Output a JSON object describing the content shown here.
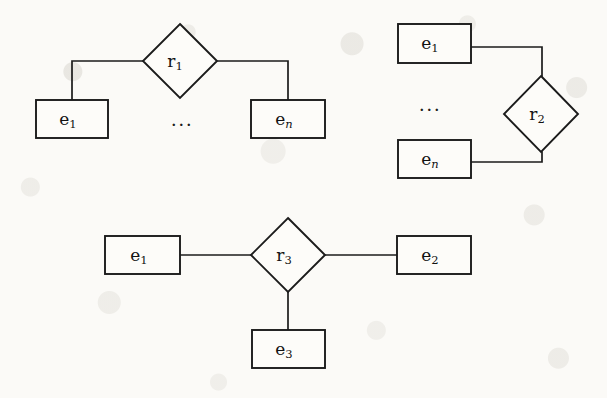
{
  "figure": {
    "name": "entity-relationship-diagram-figure",
    "background_color": "#fbfaf7",
    "ink_color": "#1b1b1b",
    "width": 607,
    "height": 398
  },
  "diagrams": [
    {
      "id": "diagram-1",
      "relationship": {
        "label": "r",
        "subscript": "1",
        "cx": 180,
        "cy": 61,
        "rx": 37,
        "ry": 37
      },
      "entities": [
        {
          "id": "d1-e1",
          "label": "e",
          "subscript": "1",
          "italic_sub": false,
          "x": 36,
          "y": 100,
          "w": 72,
          "h": 38
        },
        {
          "id": "d1-en",
          "label": "e",
          "subscript": "n",
          "italic_sub": true,
          "x": 251,
          "y": 100,
          "w": 74,
          "h": 38
        }
      ],
      "ellipsis": {
        "text": "...",
        "x": 182,
        "y": 121
      },
      "edges": [
        {
          "id": "d1-edge-left",
          "points": "143,61 72,61 72,100"
        },
        {
          "id": "d1-edge-right",
          "points": "218,61 288,61 288,100"
        }
      ]
    },
    {
      "id": "diagram-2",
      "relationship": {
        "label": "r",
        "subscript": "2",
        "cx": 541,
        "cy": 114,
        "rx": 37,
        "ry": 38
      },
      "entities": [
        {
          "id": "d2-e1",
          "label": "e",
          "subscript": "1",
          "italic_sub": false,
          "x": 398,
          "y": 24,
          "w": 73,
          "h": 39
        },
        {
          "id": "d2-en",
          "label": "e",
          "subscript": "n",
          "italic_sub": true,
          "x": 398,
          "y": 140,
          "w": 73,
          "h": 38
        }
      ],
      "ellipsis": {
        "text": "...",
        "x": 430,
        "y": 106
      },
      "edges": [
        {
          "id": "d2-edge-top",
          "points": "471,47 542,47 542,76"
        },
        {
          "id": "d2-edge-bottom",
          "points": "471,162 542,162 542,152"
        }
      ]
    },
    {
      "id": "diagram-3",
      "relationship": {
        "label": "r",
        "subscript": "3",
        "cx": 288,
        "cy": 255,
        "rx": 37,
        "ry": 37
      },
      "entities": [
        {
          "id": "d3-e1",
          "label": "e",
          "subscript": "1",
          "italic_sub": false,
          "x": 105,
          "y": 236,
          "w": 75,
          "h": 38
        },
        {
          "id": "d3-e2",
          "label": "e",
          "subscript": "2",
          "italic_sub": false,
          "x": 397,
          "y": 236,
          "w": 74,
          "h": 38
        },
        {
          "id": "d3-e3",
          "label": "e",
          "subscript": "3",
          "italic_sub": false,
          "x": 252,
          "y": 330,
          "w": 73,
          "h": 38
        }
      ],
      "ellipsis": null,
      "edges": [
        {
          "id": "d3-edge-left",
          "points": "180,255 251,255"
        },
        {
          "id": "d3-edge-right",
          "points": "325,255 397,255"
        },
        {
          "id": "d3-edge-bottom",
          "points": "288,292 288,330"
        }
      ]
    }
  ]
}
